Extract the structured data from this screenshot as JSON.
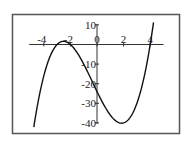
{
  "chart_data": {
    "type": "line",
    "title": "",
    "xlabel": "",
    "ylabel": "",
    "function": "y = x^3 + x^2 - 14x - 24 = (x+2)(x+3)(x-4)",
    "xlim": [
      -5.1,
      5.0
    ],
    "ylim": [
      -40,
      10
    ],
    "domain": [
      -4.75,
      4.25
    ],
    "grid": false,
    "legend": "none",
    "x_ticks": [
      {
        "value": -4,
        "label": "-4"
      },
      {
        "value": -2,
        "label": "-2"
      },
      {
        "value": 0,
        "label": "0"
      },
      {
        "value": 2,
        "label": "2"
      },
      {
        "value": 4,
        "label": "4"
      }
    ],
    "y_ticks": [
      {
        "value": 10,
        "label": "10"
      },
      {
        "value": -10,
        "label": "-10"
      },
      {
        "value": -20,
        "label": "-20"
      },
      {
        "value": -30,
        "label": "-30"
      },
      {
        "value": -40,
        "label": "-40"
      }
    ],
    "series": [
      {
        "name": "cubic",
        "coefficients": [
          1,
          1,
          -14,
          -24
        ],
        "color": "#111111",
        "key_points": [
          {
            "x": -4.75,
            "y": -40.2
          },
          {
            "x": -3,
            "y": 0
          },
          {
            "x": -2.52,
            "y": 1.6
          },
          {
            "x": -2,
            "y": 0
          },
          {
            "x": 0,
            "y": -24
          },
          {
            "x": 1.85,
            "y": -40.1
          },
          {
            "x": 4,
            "y": 0
          },
          {
            "x": 4.25,
            "y": 11.3
          }
        ]
      }
    ],
    "colors": {
      "frame": "#555555",
      "axis": "#333333",
      "curve": "#111111",
      "text": "#222222"
    }
  }
}
